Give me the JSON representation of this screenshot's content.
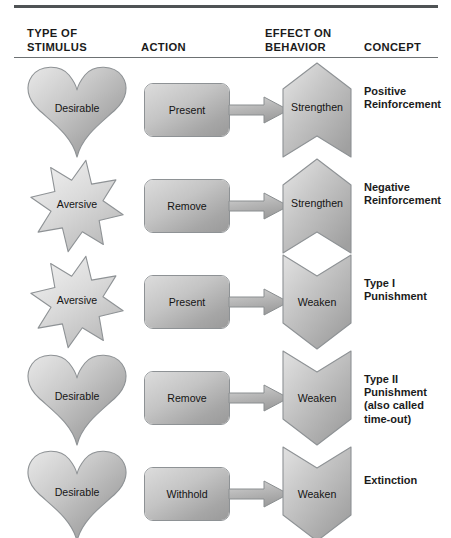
{
  "figure": {
    "columns": [
      {
        "id": "stimulus",
        "label": "TYPE OF\nSTIMULUS"
      },
      {
        "id": "action",
        "label": "ACTION"
      },
      {
        "id": "effect",
        "label": "EFFECT ON\nBEHAVIOR"
      },
      {
        "id": "concept",
        "label": "CONCEPT"
      }
    ],
    "rows": [
      {
        "stimulus": {
          "label": "Desirable",
          "shape": "heart"
        },
        "action": {
          "label": "Present"
        },
        "arrow": {
          "icon": "right-arrow-icon"
        },
        "effect": {
          "label": "Strengthen",
          "shape": "chevron-up"
        },
        "concept": {
          "label": "Positive\nReinforcement"
        }
      },
      {
        "stimulus": {
          "label": "Aversive",
          "shape": "star"
        },
        "action": {
          "label": "Remove"
        },
        "arrow": {
          "icon": "right-arrow-icon"
        },
        "effect": {
          "label": "Strengthen",
          "shape": "chevron-up"
        },
        "concept": {
          "label": "Negative\nReinforcement"
        }
      },
      {
        "stimulus": {
          "label": "Aversive",
          "shape": "star"
        },
        "action": {
          "label": "Present"
        },
        "arrow": {
          "icon": "right-arrow-icon"
        },
        "effect": {
          "label": "Weaken",
          "shape": "chevron-down"
        },
        "concept": {
          "label": "Type I\nPunishment"
        }
      },
      {
        "stimulus": {
          "label": "Desirable",
          "shape": "heart"
        },
        "action": {
          "label": "Remove"
        },
        "arrow": {
          "icon": "right-arrow-icon"
        },
        "effect": {
          "label": "Weaken",
          "shape": "chevron-down"
        },
        "concept": {
          "label": "Type II\nPunishment\n(also called\ntime-out)"
        }
      },
      {
        "stimulus": {
          "label": "Desirable",
          "shape": "heart"
        },
        "action": {
          "label": "Withhold"
        },
        "arrow": {
          "icon": "right-arrow-icon"
        },
        "effect": {
          "label": "Weaken",
          "shape": "chevron-down"
        },
        "concept": {
          "label": "Extinction"
        }
      }
    ],
    "colors": {
      "rule": "#4f5355",
      "header_rule": "#6d7173",
      "text": "#1b1b1b",
      "shape_stroke": "#8e9295",
      "shape_light": "#e6e6e6",
      "shape_mid": "#c2c2c2",
      "shape_dark": "#9a9a9a",
      "background": "#ffffff"
    }
  }
}
